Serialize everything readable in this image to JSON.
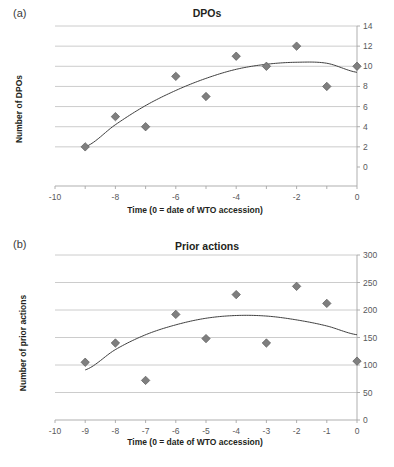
{
  "figure": {
    "panels": [
      {
        "letter": "(a)",
        "title": "DPOs",
        "xlabel": "Time (0 = date of WTO accession)",
        "ylabel": "Number of DPOs"
      },
      {
        "letter": "(b)",
        "title": "Prior actions",
        "xlabel": "Time (0 = date of WTO accession)",
        "ylabel": "Number of prior actions"
      }
    ]
  },
  "colors": {
    "marker": "#7f7f7f",
    "marker_edge": "#595959",
    "trendline": "#3f3f3f",
    "gridline": "#bfbfbf",
    "axis": "#a6a6a6",
    "text": "#58595b",
    "title": "#231f20",
    "background": "#ffffff"
  },
  "chart_data": [
    {
      "type": "scatter",
      "panel": "(a)",
      "title": "DPOs",
      "xlabel": "Time (0 = date of WTO accession)",
      "ylabel": "Number of DPOs",
      "xlim": [
        -10,
        0
      ],
      "ylim": [
        0,
        14
      ],
      "xticks": [
        -10,
        -9,
        -8,
        -7,
        -6,
        -5,
        -4,
        -3,
        -2,
        -1,
        0
      ],
      "xticklabels": [
        "-10",
        "",
        "-8",
        "",
        "-6",
        "",
        "-4",
        "",
        "-2",
        "",
        "0"
      ],
      "yticks": [
        0,
        2,
        4,
        6,
        8,
        10,
        12,
        14
      ],
      "yticklabels": [
        "0",
        "2",
        "4",
        "6",
        "8",
        "10",
        "12",
        "14"
      ],
      "y_axis_position": "right",
      "grid": "horizontal",
      "legend": "none",
      "x": [
        -9,
        -8,
        -7,
        -6,
        -5,
        -4,
        -3,
        -2,
        -1,
        0
      ],
      "y": [
        2,
        5,
        4,
        9,
        7,
        11,
        10,
        12,
        8,
        10
      ],
      "series": [
        {
          "name": "DPOs",
          "marker": "diamond",
          "x": [
            -9,
            -8,
            -7,
            -6,
            -5,
            -4,
            -3,
            -2,
            -1,
            0
          ],
          "values": [
            2,
            5,
            4,
            9,
            7,
            11,
            10,
            12,
            8,
            10
          ]
        },
        {
          "name": "Poly. trend",
          "type": "line",
          "fit": "quadratic",
          "x": [
            -9,
            -8,
            -7,
            -6,
            -5,
            -4,
            -3,
            -2,
            -1,
            0
          ],
          "values": [
            2.0,
            4.2,
            6.1,
            7.6,
            8.8,
            9.7,
            10.2,
            10.4,
            10.3,
            9.4
          ]
        }
      ]
    },
    {
      "type": "scatter",
      "panel": "(b)",
      "title": "Prior actions",
      "xlabel": "Time (0 = date of WTO accession)",
      "ylabel": "Number of prior actions",
      "xlim": [
        -10,
        0
      ],
      "ylim": [
        0,
        300
      ],
      "xticks": [
        -10,
        -9,
        -8,
        -7,
        -6,
        -5,
        -4,
        -3,
        -2,
        -1,
        0
      ],
      "xticklabels": [
        "-10",
        "-9",
        "-8",
        "-7",
        "-6",
        "-5",
        "-4",
        "-3",
        "-2",
        "-1",
        "0"
      ],
      "yticks": [
        0,
        50,
        100,
        150,
        200,
        250,
        300
      ],
      "yticklabels": [
        "0",
        "50",
        "100",
        "150",
        "200",
        "250",
        "300"
      ],
      "y_axis_position": "right",
      "grid": "horizontal",
      "legend": "none",
      "x": [
        -9,
        -8,
        -7,
        -6,
        -5,
        -4,
        -3,
        -2,
        -1,
        0
      ],
      "y": [
        105,
        140,
        72,
        192,
        148,
        228,
        140,
        243,
        212,
        107
      ],
      "series": [
        {
          "name": "Prior actions",
          "marker": "diamond",
          "x": [
            -9,
            -8,
            -7,
            -6,
            -5,
            -4,
            -3,
            -2,
            -1,
            0
          ],
          "values": [
            105,
            140,
            72,
            192,
            148,
            228,
            140,
            243,
            212,
            107
          ]
        },
        {
          "name": "Poly. trend",
          "type": "line",
          "fit": "quadratic",
          "x": [
            -9,
            -8,
            -7,
            -6,
            -5,
            -4,
            -3,
            -2,
            -1,
            0
          ],
          "values": [
            91,
            128,
            155,
            173,
            185,
            190,
            189,
            182,
            171,
            155
          ]
        }
      ]
    }
  ]
}
